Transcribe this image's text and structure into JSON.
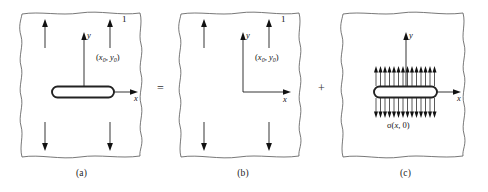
{
  "figure": {
    "title_hidden": "",
    "operators": {
      "equals": "=",
      "plus": "+"
    },
    "panels": [
      {
        "id": "a",
        "caption": "(a)",
        "has_crack": true,
        "has_remote_load": true,
        "has_crack_face_pressure": false,
        "labels": {
          "x_axis": "x",
          "y_axis": "y",
          "load_magnitude": "1",
          "point": "(x",
          "point_sub1": "0",
          "point_mid": ", y",
          "point_sub2": "0",
          "point_end": ")"
        }
      },
      {
        "id": "b",
        "caption": "(b)",
        "has_crack": false,
        "has_remote_load": true,
        "has_crack_face_pressure": false,
        "labels": {
          "x_axis": "x",
          "y_axis": "y",
          "load_magnitude": "1",
          "point": "(x",
          "point_sub1": "0",
          "point_mid": ", y",
          "point_sub2": "0",
          "point_end": ")"
        }
      },
      {
        "id": "c",
        "caption": "(c)",
        "has_crack": true,
        "has_remote_load": false,
        "has_crack_face_pressure": true,
        "labels": {
          "x_axis": "x",
          "y_axis": "y",
          "pressure": "σ(x",
          "pressure_mid": ", 0)"
        }
      }
    ],
    "colors": {
      "outline": "#555555",
      "crack": "#222222",
      "axis": "#111111",
      "text": "#111111",
      "background": "#ffffff"
    }
  }
}
